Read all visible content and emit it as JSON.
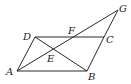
{
  "diagram": {
    "type": "geometry",
    "points": {
      "A": {
        "x": 17,
        "y": 71
      },
      "B": {
        "x": 87,
        "y": 71
      },
      "C": {
        "x": 104,
        "y": 37
      },
      "D": {
        "x": 35,
        "y": 37
      },
      "E": {
        "x": 53,
        "y": 50
      },
      "F": {
        "x": 73,
        "y": 37
      },
      "G": {
        "x": 118,
        "y": 10
      }
    },
    "labels": {
      "A": "A",
      "B": "B",
      "C": "C",
      "D": "D",
      "E": "E",
      "F": "F",
      "G": "G"
    },
    "segments": [
      [
        "A",
        "B"
      ],
      [
        "B",
        "C"
      ],
      [
        "C",
        "D"
      ],
      [
        "D",
        "A"
      ],
      [
        "D",
        "B"
      ],
      [
        "A",
        "G"
      ],
      [
        "C",
        "G"
      ]
    ]
  }
}
